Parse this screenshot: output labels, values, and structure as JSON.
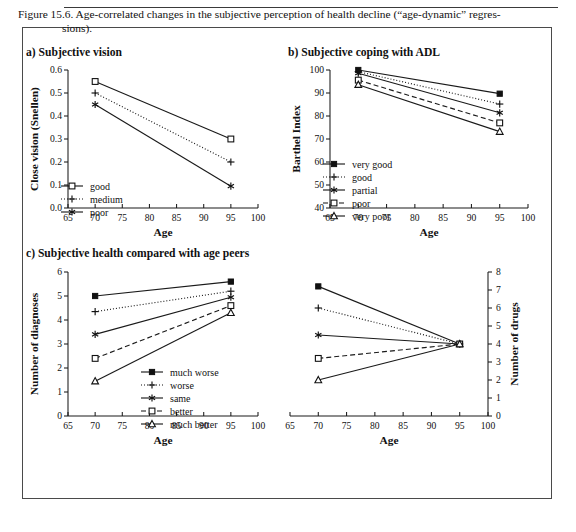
{
  "figure": {
    "caption_line1": "Figure 15.6. Age-correlated changes in the subjective perception of health decline (“age-dynamic” regres-",
    "caption_line2": "sions)."
  },
  "panels": {
    "a_title": "a)  Subjective vision",
    "b_title": "b)  Subjective coping with ADL",
    "c_title": "c)  Subjective health compared with age peers"
  },
  "axis": {
    "x_label": "Age",
    "x_ticks": [
      "65",
      "70",
      "75",
      "80",
      "85",
      "90",
      "95",
      "100"
    ]
  },
  "chart_data": [
    {
      "type": "line",
      "id": "a",
      "title": "a)  Subjective vision",
      "xlabel": "Age",
      "ylabel": "Close vision (Snellen)",
      "x": [
        70,
        95
      ],
      "xlim": [
        65,
        100
      ],
      "ylim": [
        0.0,
        0.6
      ],
      "xticks": [
        65,
        70,
        75,
        80,
        85,
        90,
        95,
        100
      ],
      "yticks": [
        "0.0",
        "0.1",
        "0.2",
        "0.3",
        "0.4",
        "0.5",
        "0.6"
      ],
      "grid": false,
      "legend_position": "lower-left",
      "series": [
        {
          "name": "good",
          "values": [
            0.55,
            0.3
          ],
          "marker": "open-square",
          "dash": "solid"
        },
        {
          "name": "medium",
          "values": [
            0.5,
            0.2
          ],
          "marker": "plus",
          "dash": "dotted"
        },
        {
          "name": "poor",
          "values": [
            0.45,
            0.095
          ],
          "marker": "asterisk",
          "dash": "solid"
        }
      ]
    },
    {
      "type": "line",
      "id": "b",
      "title": "b)  Subjective coping with ADL",
      "xlabel": "Age",
      "ylabel": "Barthel Index",
      "x": [
        70,
        95
      ],
      "xlim": [
        65,
        100
      ],
      "ylim": [
        40,
        100
      ],
      "xticks": [
        65,
        70,
        75,
        80,
        85,
        90,
        95,
        100
      ],
      "yticks": [
        "40",
        "50",
        "60",
        "70",
        "80",
        "90",
        "100"
      ],
      "grid": false,
      "legend_position": "lower-left",
      "series": [
        {
          "name": "very good",
          "values": [
            100.0,
            89.7
          ],
          "marker": "filled-square",
          "dash": "solid"
        },
        {
          "name": "good",
          "values": [
            99.3,
            85.2
          ],
          "marker": "plus",
          "dash": "dotted"
        },
        {
          "name": "partial",
          "values": [
            98.6,
            81.4
          ],
          "marker": "asterisk",
          "dash": "solid"
        },
        {
          "name": "poor",
          "values": [
            95.6,
            77.0
          ],
          "marker": "open-square",
          "dash": "dashed"
        },
        {
          "name": "very poor",
          "values": [
            93.6,
            73.2
          ],
          "marker": "open-triangle",
          "dash": "solid"
        }
      ]
    },
    {
      "type": "line",
      "id": "c-left",
      "title": "c)  Subjective health compared with age peers",
      "xlabel": "Age",
      "ylabel": "Number of diagnoses",
      "x": [
        70,
        95
      ],
      "xlim": [
        65,
        100
      ],
      "ylim": [
        0,
        6
      ],
      "xticks": [
        65,
        70,
        75,
        80,
        85,
        90,
        95,
        100
      ],
      "yticks": [
        "0",
        "1",
        "2",
        "3",
        "4",
        "5",
        "6"
      ],
      "grid": false,
      "legend_position": "lower-right",
      "series": [
        {
          "name": "much worse",
          "values": [
            5.0,
            5.6
          ],
          "marker": "filled-square",
          "dash": "solid"
        },
        {
          "name": "worse",
          "values": [
            4.35,
            5.2
          ],
          "marker": "plus",
          "dash": "dotted"
        },
        {
          "name": "same",
          "values": [
            3.4,
            4.95
          ],
          "marker": "asterisk",
          "dash": "solid"
        },
        {
          "name": "better",
          "values": [
            2.4,
            4.6
          ],
          "marker": "open-square",
          "dash": "dashed"
        },
        {
          "name": "much better",
          "values": [
            1.45,
            4.3
          ],
          "marker": "open-triangle",
          "dash": "solid"
        }
      ]
    },
    {
      "type": "line",
      "id": "c-right",
      "title": "",
      "xlabel": "Age",
      "ylabel": "Number of drugs",
      "x": [
        70,
        95
      ],
      "xlim": [
        65,
        100
      ],
      "ylim": [
        0,
        8
      ],
      "xticks": [
        65,
        70,
        75,
        80,
        85,
        90,
        95,
        100
      ],
      "yticks": [
        "0",
        "1",
        "2",
        "3",
        "4",
        "5",
        "6",
        "7",
        "8"
      ],
      "y_axis_side": "right",
      "grid": false,
      "legend_position": "none",
      "series": [
        {
          "name": "much worse",
          "values": [
            7.2,
            4.0
          ],
          "marker": "filled-square",
          "dash": "solid"
        },
        {
          "name": "worse",
          "values": [
            6.0,
            4.0
          ],
          "marker": "plus",
          "dash": "dotted"
        },
        {
          "name": "same",
          "values": [
            4.5,
            4.0
          ],
          "marker": "asterisk",
          "dash": "solid"
        },
        {
          "name": "better",
          "values": [
            3.2,
            4.0
          ],
          "marker": "open-square",
          "dash": "dashed"
        },
        {
          "name": "much better",
          "values": [
            2.0,
            4.0
          ],
          "marker": "open-triangle",
          "dash": "solid"
        }
      ]
    }
  ]
}
